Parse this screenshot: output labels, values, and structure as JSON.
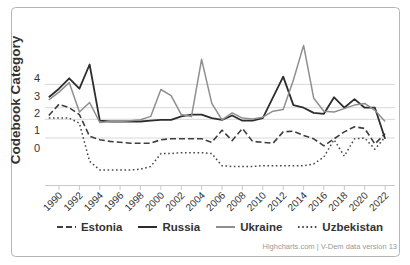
{
  "chart_data": {
    "type": "line",
    "title": "",
    "xlabel": "",
    "ylabel": "Codebook Category",
    "x": [
      1989,
      1990,
      1991,
      1992,
      1993,
      1994,
      1995,
      1996,
      1997,
      1998,
      1999,
      2000,
      2001,
      2002,
      2003,
      2004,
      2005,
      2006,
      2007,
      2008,
      2009,
      2010,
      2011,
      2012,
      2013,
      2014,
      2015,
      2016,
      2017,
      2018,
      2019,
      2020,
      2021,
      2022
    ],
    "series": [
      {
        "name": "Estonia",
        "dash": "dash",
        "color": "#3f3f3f",
        "width": 1.6,
        "values": [
          1.85,
          2.5,
          2.3,
          1.9,
          0.65,
          0.45,
          0.35,
          0.3,
          0.25,
          0.25,
          0.25,
          0.45,
          0.5,
          0.5,
          0.5,
          0.5,
          0.3,
          1.0,
          0.4,
          1.1,
          0.35,
          0.3,
          0.25,
          0.9,
          0.95,
          0.7,
          0.5,
          0.1,
          0.5,
          0.9,
          1.2,
          1.1,
          0.2,
          0.8
        ]
      },
      {
        "name": "Russia",
        "dash": "solid",
        "color": "#2d2d2d",
        "width": 1.8,
        "values": [
          2.9,
          3.4,
          4.0,
          3.4,
          4.8,
          1.55,
          1.5,
          1.5,
          1.5,
          1.5,
          1.55,
          1.6,
          1.6,
          1.8,
          1.9,
          1.9,
          1.7,
          1.6,
          1.85,
          1.55,
          1.55,
          1.7,
          2.9,
          4.1,
          2.45,
          2.3,
          2.0,
          1.95,
          2.9,
          2.3,
          2.8,
          2.3,
          2.3,
          0.5
        ]
      },
      {
        "name": "Ukraine",
        "dash": "solid",
        "color": "#8f8f8f",
        "width": 1.5,
        "values": [
          2.75,
          3.2,
          3.75,
          2.05,
          2.6,
          1.45,
          1.5,
          1.5,
          1.55,
          1.6,
          1.8,
          3.35,
          3.0,
          1.9,
          1.8,
          5.1,
          2.55,
          1.6,
          2.0,
          1.7,
          1.65,
          1.75,
          2.1,
          2.2,
          3.9,
          5.9,
          2.85,
          2.1,
          2.05,
          2.25,
          2.45,
          2.55,
          2.15,
          1.5
        ]
      },
      {
        "name": "Uzbekistan",
        "dash": "dot",
        "color": "#474747",
        "width": 1.5,
        "values": [
          1.7,
          1.7,
          1.7,
          1.4,
          -0.8,
          -1.3,
          -1.3,
          -1.3,
          -1.3,
          -1.25,
          -1.1,
          -0.35,
          -0.35,
          -0.3,
          -0.3,
          -0.3,
          -0.35,
          -1.05,
          -1.1,
          -1.1,
          -1.1,
          -1.05,
          -1.05,
          -1.05,
          -1.05,
          -1.05,
          -0.95,
          -0.55,
          0.45,
          -0.5,
          0.5,
          0.55,
          -0.1,
          0.6
        ]
      }
    ],
    "yticks": [
      4,
      3,
      2,
      1,
      0
    ],
    "xticks": [
      1990,
      1992,
      1994,
      1996,
      1998,
      2000,
      2002,
      2004,
      2006,
      2008,
      2010,
      2012,
      2014,
      2016,
      2018,
      2020,
      2022
    ],
    "category_threshold_gridlines": [
      0.55,
      1.63,
      2.3,
      3.65
    ],
    "ylim": [
      -2.2,
      7.7
    ],
    "xlim": [
      1989,
      2023
    ],
    "grid": "horizontal-thresholds-only",
    "legend_position": "bottom"
  },
  "legend": {
    "items": [
      "Estonia",
      "Russia",
      "Ukraine",
      "Uzbekistan"
    ]
  },
  "credits": {
    "text": "Highcharts.com | V-Dem data version 13"
  },
  "colors": {
    "gridline": "#d8d8d8",
    "axis_line": "#c9c9c9",
    "tick_text": "#333333",
    "axis_title": "#333333",
    "credits_text": "#999999",
    "frame_border": "#b5b5b5",
    "background": "#ffffff"
  }
}
